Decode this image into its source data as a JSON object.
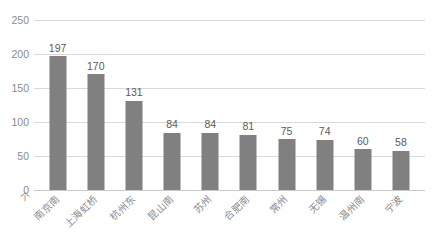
{
  "chart_data": {
    "type": "bar",
    "title": "",
    "xlabel": "",
    "ylabel": "",
    "unit_label": "个",
    "ylim": [
      0,
      250
    ],
    "yticks": [
      0,
      50,
      100,
      150,
      200,
      250
    ],
    "grid": true,
    "legend": "none",
    "bar_color": "#808080",
    "gridline_color": "#d9d9d9",
    "label_color": "#8b8b8b",
    "value_color": "#5a5a5a",
    "categories": [
      "南京南",
      "上海虹桥",
      "杭州东",
      "昆山南",
      "苏州",
      "合肥南",
      "常州",
      "无锡",
      "温州南",
      "宁波"
    ],
    "values": [
      197,
      170,
      131,
      84,
      84,
      81,
      75,
      74,
      60,
      58
    ]
  }
}
